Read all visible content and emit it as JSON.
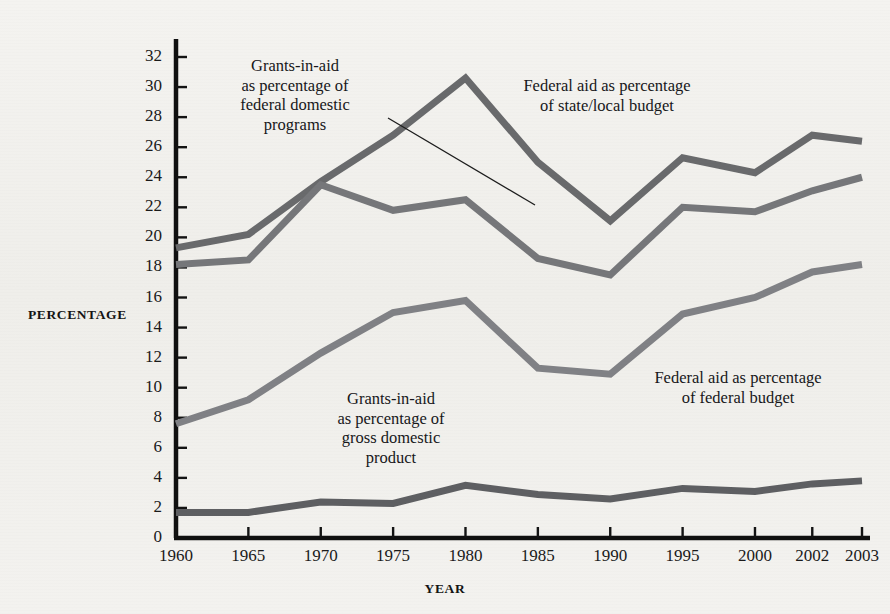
{
  "chart_data": {
    "type": "line",
    "title": "",
    "xlabel": "YEAR",
    "ylabel": "PERCENTAGE",
    "categories": [
      "1960",
      "1965",
      "1970",
      "1975",
      "1980",
      "1985",
      "1990",
      "1995",
      "2000",
      "2002",
      "2003"
    ],
    "x_tick_labels": [
      "1960",
      "1965",
      "1970",
      "1975",
      "1980",
      "1985",
      "1990",
      "1995",
      "2000",
      "2002",
      "2003"
    ],
    "y_tick_labels": [
      "0",
      "2",
      "4",
      "6",
      "8",
      "10",
      "12",
      "14",
      "16",
      "18",
      "20",
      "22",
      "24",
      "26",
      "28",
      "30",
      "32"
    ],
    "ylim": [
      0,
      32
    ],
    "y_tick_step": 2,
    "grid": false,
    "legend_position": "inline-annotations",
    "series": [
      {
        "name": "Federal aid as percentage of state/local budget",
        "color": "#696a6c",
        "values": [
          19.3,
          20.2,
          23.7,
          26.8,
          30.6,
          25.0,
          21.1,
          25.3,
          24.3,
          26.8,
          26.4
        ]
      },
      {
        "name": "Grants-in-aid as percentage of federal domestic programs",
        "color": "#76777a",
        "values": [
          18.2,
          18.5,
          23.5,
          21.8,
          22.5,
          18.6,
          17.5,
          22.0,
          21.7,
          23.1,
          24.0
        ]
      },
      {
        "name": "Federal aid as percentage of federal budget",
        "color": "#808185",
        "values": [
          7.6,
          9.2,
          12.3,
          15.0,
          15.8,
          11.3,
          10.9,
          14.9,
          16.0,
          17.7,
          18.2
        ]
      },
      {
        "name": "Grants-in-aid as percentage of gross domestic product",
        "color": "#5e5f62",
        "values": [
          1.7,
          1.7,
          2.4,
          2.3,
          3.5,
          2.9,
          2.6,
          3.3,
          3.1,
          3.6,
          3.8
        ]
      }
    ],
    "annotations": [
      {
        "id": "grants-federal-domestic",
        "text": "Grants-in-aid\nas percentage of\nfederal domestic\nprograms",
        "has_leader_line": true
      },
      {
        "id": "state-local",
        "text": "Federal aid as percentage\nof state/local budget",
        "has_leader_line": false
      },
      {
        "id": "grants-gdp",
        "text": "Grants-in-aid\nas percentage of\ngross domestic\nproduct",
        "has_leader_line": false
      },
      {
        "id": "federal-budget",
        "text": "Federal aid as percentage\nof federal budget",
        "has_leader_line": false
      }
    ]
  },
  "axes": {
    "y_title": "PERCENTAGE",
    "x_title": "YEAR"
  }
}
